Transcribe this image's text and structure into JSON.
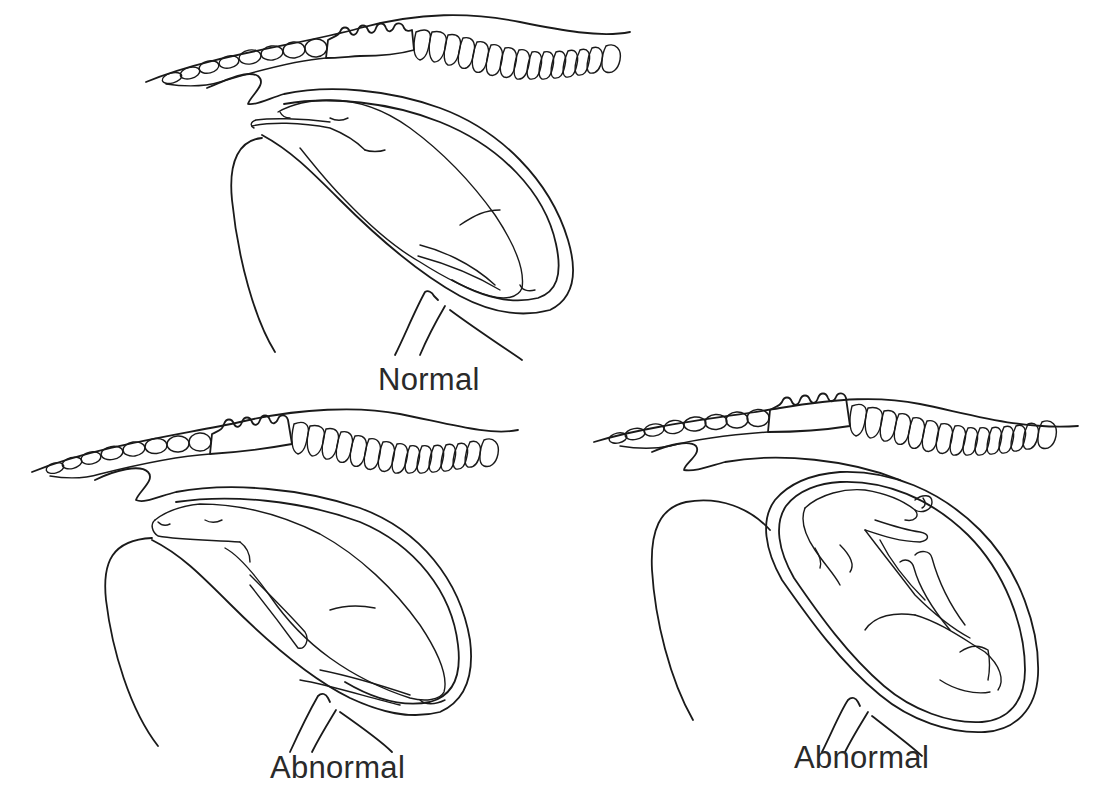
{
  "diagram": {
    "stroke_color": "#1a1a1a",
    "background": "#ffffff",
    "panels": [
      {
        "id": "normal",
        "label": "Normal",
        "position": "top-center",
        "description": "Calf in upper uterus, head and forelimbs extended toward birth canal"
      },
      {
        "id": "abnormal-1",
        "label": "Abnormal",
        "position": "bottom-left",
        "description": "Calf with head extended but forelimbs flexed back beneath the body"
      },
      {
        "id": "abnormal-2",
        "label": "Abnormal",
        "position": "bottom-right",
        "description": "Calf inverted with head turned back along the body inside the uterus"
      }
    ]
  }
}
